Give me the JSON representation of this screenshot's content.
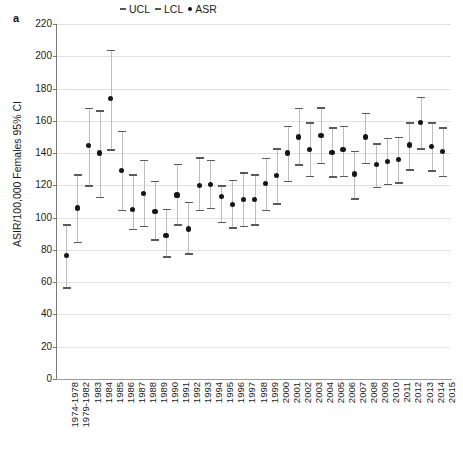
{
  "figure": {
    "panel_letter": "a",
    "background_color": "#ffffff",
    "marker_color": "#161616",
    "ci_color": "#bdbdbd"
  },
  "legend": {
    "position": "top-center",
    "items": [
      {
        "label": "UCL",
        "glyph": "dash"
      },
      {
        "label": "LCL",
        "glyph": "dash"
      },
      {
        "label": "ASR",
        "glyph": "dot"
      }
    ]
  },
  "chart_data": {
    "type": "scatter",
    "title": "",
    "subtitle": "",
    "xlabel": "",
    "ylabel": "ASIR/100,000 Females 95% CI",
    "ylim": [
      0,
      220
    ],
    "ytick_step": 20,
    "yticks": [
      0,
      20,
      40,
      60,
      80,
      100,
      120,
      140,
      160,
      180,
      200,
      220
    ],
    "grid": true,
    "legend_position": "top-center",
    "categories": [
      "1974-1978",
      "1979-1982",
      "1983",
      "1984",
      "1985",
      "1986",
      "1987",
      "1988",
      "1989",
      "1990",
      "1991",
      "1992",
      "1993",
      "1994",
      "1995",
      "1996",
      "1997",
      "1998",
      "1999",
      "2000",
      "2001",
      "2002",
      "2003",
      "2004",
      "2005",
      "2006",
      "2007",
      "2008",
      "2009",
      "2010",
      "2011",
      "2012",
      "2013",
      "2014",
      "2015"
    ],
    "series": [
      {
        "name": "ASR",
        "values": [
          76.5,
          106.0,
          144.5,
          140.0,
          174.0,
          129.0,
          105.0,
          115.0,
          104.0,
          89.0,
          114.0,
          93.0,
          120.0,
          120.5,
          113.0,
          108.0,
          111.0,
          111.0,
          121.0,
          126.0,
          140.0,
          150.0,
          142.0,
          151.0,
          140.5,
          142.0,
          127.0,
          150.0,
          133.0,
          135.0,
          136.0,
          145.0,
          159.0,
          144.0,
          141.0
        ]
      },
      {
        "name": "UCL",
        "values": [
          96.0,
          127.0,
          168.0,
          166.5,
          204.0,
          154.0,
          127.0,
          136.0,
          123.0,
          105.5,
          133.5,
          110.0,
          137.5,
          136.0,
          120.0,
          123.5,
          128.0,
          127.0,
          137.0,
          143.0,
          157.0,
          168.0,
          159.0,
          168.5,
          156.0,
          157.0,
          141.5,
          165.0,
          146.0,
          149.5,
          150.0,
          159.0,
          175.0,
          159.0,
          156.0
        ]
      },
      {
        "name": "LCL",
        "values": [
          57.0,
          85.0,
          120.0,
          113.0,
          142.5,
          105.0,
          93.0,
          95.0,
          86.5,
          76.0,
          96.0,
          78.0,
          105.0,
          106.0,
          97.5,
          94.0,
          95.0,
          96.0,
          105.0,
          109.0,
          123.0,
          133.0,
          126.0,
          134.0,
          125.5,
          126.0,
          112.0,
          134.0,
          119.0,
          121.0,
          122.0,
          130.0,
          143.0,
          129.5,
          126.0
        ]
      }
    ]
  }
}
